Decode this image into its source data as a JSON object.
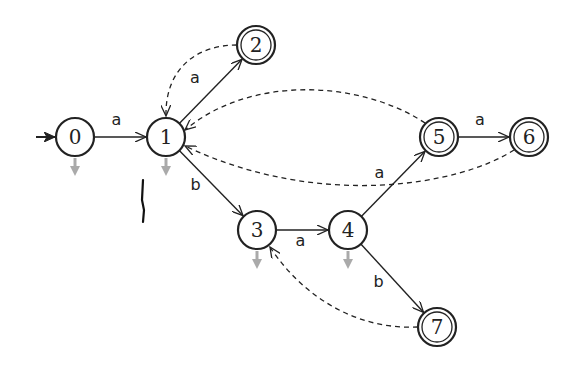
{
  "diagram": {
    "type": "automaton",
    "colors": {
      "stroke": "#222222",
      "failure_arrow": "#aaaaaa",
      "mark": "#111111"
    },
    "start_state": "0",
    "states": [
      {
        "id": "0",
        "label": "0",
        "accepting": false,
        "failure_down": true
      },
      {
        "id": "1",
        "label": "1",
        "accepting": false,
        "failure_down": true
      },
      {
        "id": "2",
        "label": "2",
        "accepting": true,
        "failure_down": false
      },
      {
        "id": "3",
        "label": "3",
        "accepting": false,
        "failure_down": true
      },
      {
        "id": "4",
        "label": "4",
        "accepting": false,
        "failure_down": true
      },
      {
        "id": "5",
        "label": "5",
        "accepting": true,
        "failure_down": false
      },
      {
        "id": "6",
        "label": "6",
        "accepting": true,
        "failure_down": false
      },
      {
        "id": "7",
        "label": "7",
        "accepting": true,
        "failure_down": false
      }
    ],
    "transitions": [
      {
        "from": "0",
        "to": "1",
        "label": "a"
      },
      {
        "from": "1",
        "to": "2",
        "label": "a"
      },
      {
        "from": "1",
        "to": "3",
        "label": "b"
      },
      {
        "from": "3",
        "to": "4",
        "label": "a"
      },
      {
        "from": "4",
        "to": "5",
        "label": "a"
      },
      {
        "from": "5",
        "to": "6",
        "label": "a"
      },
      {
        "from": "4",
        "to": "7",
        "label": "b"
      }
    ],
    "failure_links": [
      {
        "from": "2",
        "to": "1"
      },
      {
        "from": "5",
        "to": "1"
      },
      {
        "from": "6",
        "to": "1"
      },
      {
        "from": "7",
        "to": "3"
      }
    ]
  }
}
